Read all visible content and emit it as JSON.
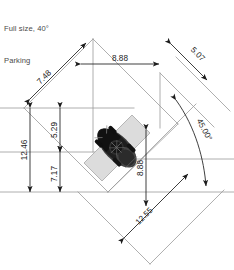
{
  "title_block": {
    "line1": "Full size, 40°",
    "line2": "Parking"
  },
  "drawing": {
    "subject": "parking-stall-plan",
    "vehicle_icon": "car-top-view",
    "stall_angle_deg": 45,
    "colors": {
      "dimension_line": "#1c1c1c",
      "geometry_line": "#9a9a9a",
      "stall_fill": "#dcdcdc",
      "stall_stroke": "#b0b0b0",
      "text": "#1c1c1c",
      "title_text": "#4a4a4a",
      "vehicle": "#2a2a2a",
      "background": "#ffffff"
    },
    "dimensions": [
      {
        "id": "d-748",
        "label": "7.48",
        "orientation": "diagonal-up-right",
        "position": "upper-left"
      },
      {
        "id": "d-888-t",
        "label": "8.88",
        "orientation": "horizontal",
        "position": "top"
      },
      {
        "id": "d-507",
        "label": "5.07",
        "orientation": "diagonal-down-right",
        "position": "upper-right"
      },
      {
        "id": "d-1246",
        "label": "12.46",
        "orientation": "vertical",
        "position": "far-left"
      },
      {
        "id": "d-529",
        "label": "5.29",
        "orientation": "vertical",
        "position": "left-upper"
      },
      {
        "id": "d-717",
        "label": "7.17",
        "orientation": "vertical",
        "position": "left-lower"
      },
      {
        "id": "d-4500",
        "label": "45.00°",
        "orientation": "angular-arc",
        "position": "right"
      },
      {
        "id": "d-888-r",
        "label": "8.88",
        "orientation": "vertical",
        "position": "right-inner"
      },
      {
        "id": "d-1255",
        "label": "12.55",
        "orientation": "diagonal-down-right",
        "position": "bottom-right"
      }
    ]
  }
}
